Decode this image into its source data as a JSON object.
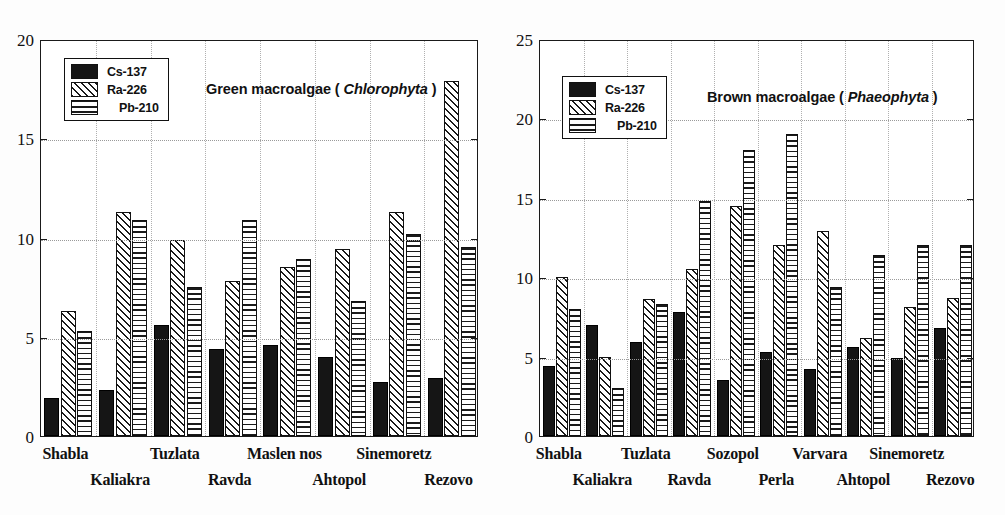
{
  "chart_data": [
    {
      "type": "bar",
      "panel": "left",
      "title_prefix": "Green macroalgae ( ",
      "title_species": "Chlorophyta",
      "title_suffix": " )",
      "categories": [
        "Shabla",
        "Kaliakra",
        "Tuzlata",
        "Ravda",
        "Maslen nos",
        "Ahtopol",
        "Sinemoretz",
        "Rezovo"
      ],
      "series": [
        {
          "name": "Cs-137",
          "pattern": "solid-black",
          "values": [
            1.9,
            2.3,
            5.6,
            4.4,
            4.6,
            4.0,
            2.7,
            2.9
          ]
        },
        {
          "name": "Ra-226",
          "pattern": "diagonal-hatch",
          "values": [
            6.3,
            11.3,
            9.9,
            7.8,
            8.5,
            9.4,
            11.3,
            17.9
          ]
        },
        {
          "name": "Pb-210",
          "pattern": "horizontal-lines",
          "values": [
            5.3,
            10.9,
            7.5,
            10.9,
            8.9,
            6.8,
            10.2,
            9.5
          ]
        }
      ],
      "ylim": [
        0,
        20
      ],
      "yticks": [
        0,
        5,
        10,
        15,
        20
      ],
      "xlabel": "",
      "ylabel": "",
      "grid": true,
      "legend_position": "upper-left"
    },
    {
      "type": "bar",
      "panel": "right",
      "title_prefix": "Brown macroalgae ( ",
      "title_species": "Phaeophyta",
      "title_suffix": " )",
      "categories": [
        "Shabla",
        "Kaliakra",
        "Tuzlata",
        "Ravda",
        "Sozopol",
        "Perla",
        "Varvara",
        "Ahtopol",
        "Sinemoretz",
        "Rezovo"
      ],
      "series": [
        {
          "name": "Cs-137",
          "pattern": "solid-black",
          "values": [
            4.4,
            7.0,
            5.9,
            7.8,
            3.5,
            5.3,
            4.2,
            5.6,
            4.9,
            6.8
          ]
        },
        {
          "name": "Ra-226",
          "pattern": "diagonal-hatch",
          "values": [
            10.0,
            5.0,
            8.6,
            10.5,
            14.5,
            12.0,
            12.9,
            6.2,
            8.1,
            8.7
          ]
        },
        {
          "name": "Pb-210",
          "pattern": "horizontal-lines",
          "values": [
            8.0,
            3.0,
            8.3,
            14.8,
            18.0,
            19.0,
            9.4,
            11.4,
            12.0,
            12.0
          ]
        }
      ],
      "ylim": [
        0,
        25
      ],
      "yticks": [
        0,
        5,
        10,
        15,
        20,
        25
      ],
      "xlabel": "",
      "ylabel": "",
      "grid": true,
      "legend_position": "upper-left"
    }
  ],
  "legend": {
    "entries": [
      {
        "label": "Cs-137",
        "key": "cs137"
      },
      {
        "label": "Ra-226",
        "key": "ra226"
      },
      {
        "label": "Pb-210",
        "key": "pb210"
      }
    ]
  },
  "colors": {
    "cs137": "#151515",
    "hatch": "#1a1a1a",
    "axis": "#1a1a1a",
    "grid": "#9a9a9a",
    "background": "#ffffff"
  }
}
